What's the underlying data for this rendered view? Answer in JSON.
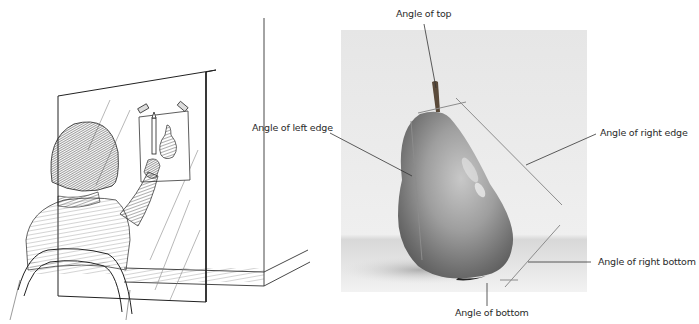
{
  "figure": {
    "left_panel": {
      "description": "pencil-sketch-artist-measuring-angles"
    },
    "right_panel": {
      "description": "photo-of-pear-with-angle-guidelines",
      "labels": {
        "top": "Angle of top",
        "left_edge": "Angle of left edge",
        "right_edge": "Angle of right edge",
        "right_bottom": "Angle of right bottom",
        "bottom": "Angle of bottom"
      }
    },
    "colors": {
      "ink": "#2a2a2a",
      "guide_line": "#8a8a8a",
      "photo_bg": "#ececec",
      "pear_mid": "#9a9a9a",
      "pear_dark": "#5a5a5a"
    }
  }
}
